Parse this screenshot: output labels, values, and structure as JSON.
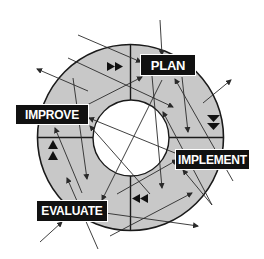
{
  "diagram": {
    "type": "cycle",
    "colors": {
      "ring_fill": "#c8c8c8",
      "ring_stroke": "#1a1a1a",
      "inner_fill": "#ffffff",
      "label_bg": "#111111",
      "label_text": "#ffffff",
      "arrow": "#2a2a2a"
    },
    "stages": [
      {
        "id": "plan",
        "label": "PLAN"
      },
      {
        "id": "implement",
        "label": "IMPLEMENT"
      },
      {
        "id": "evaluate",
        "label": "EVALUATE"
      },
      {
        "id": "improve",
        "label": "IMPROVE"
      }
    ],
    "direction_markers": [
      {
        "quadrant": "top",
        "glyph": "double-right-triangle"
      },
      {
        "quadrant": "right",
        "glyph": "double-down-triangle"
      },
      {
        "quadrant": "bottom",
        "glyph": "double-left-triangle"
      },
      {
        "quadrant": "left",
        "glyph": "double-up-triangle"
      }
    ]
  }
}
